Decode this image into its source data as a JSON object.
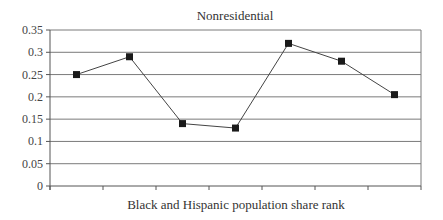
{
  "chart_data": {
    "type": "line",
    "title": "Nonresidential",
    "xlabel": "Black and Hispanic population share rank",
    "ylabel": "",
    "categories": [
      "1",
      "2",
      "3",
      "4",
      "5",
      "6",
      "7"
    ],
    "show_category_labels": false,
    "series": [
      {
        "name": "Nonresidential",
        "values": [
          0.25,
          0.29,
          0.14,
          0.13,
          0.32,
          0.28,
          0.205
        ],
        "marker": "square",
        "color": "#1a1a1a"
      }
    ],
    "ylim": [
      0,
      0.35
    ],
    "yticks": [
      0,
      0.05,
      0.1,
      0.15,
      0.2,
      0.25,
      0.3,
      0.35
    ],
    "ytick_labels": [
      "0",
      "0.05",
      "0.1",
      "0.15",
      "0.2",
      "0.25",
      "0.3",
      "0.35"
    ],
    "grid": {
      "horizontal": true,
      "vertical": false
    },
    "legend": null
  },
  "colors": {
    "gridline": "#7a7a7a",
    "axis": "#555555",
    "line": "#444444",
    "marker": "#1a1a1a"
  }
}
